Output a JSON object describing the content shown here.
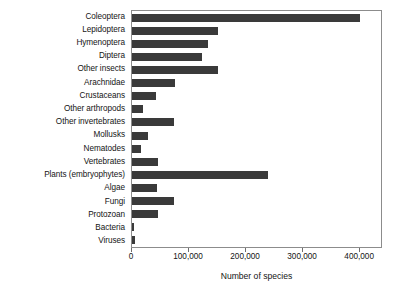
{
  "chart_data": {
    "type": "bar",
    "orientation": "horizontal",
    "title": "",
    "xlabel": "Number of species",
    "ylabel": "",
    "xlim": [
      0,
      440000
    ],
    "xticks": [
      0,
      100000,
      200000,
      300000,
      400000
    ],
    "xtick_labels": [
      "0",
      "100,000",
      "200,000",
      "300,000",
      "400,000"
    ],
    "grid": false,
    "legend": false,
    "bar_color": "#3a3a3a",
    "frame_color": "#8c8c8c",
    "categories": [
      "Coleoptera",
      "Lepidoptera",
      "Hymenoptera",
      "Diptera",
      "Other insects",
      "Arachnidae",
      "Crustaceans",
      "Other arthropods",
      "Other invertebrates",
      "Mollusks",
      "Nematodes",
      "Vertebrates",
      "Plants (embryophytes)",
      "Algae",
      "Fungi",
      "Protozoan",
      "Bacteria",
      "Viruses"
    ],
    "values": [
      400000,
      150000,
      133000,
      122000,
      150000,
      75000,
      42000,
      20000,
      73000,
      28000,
      16000,
      45000,
      239000,
      44000,
      74000,
      45000,
      4000,
      5000
    ]
  }
}
